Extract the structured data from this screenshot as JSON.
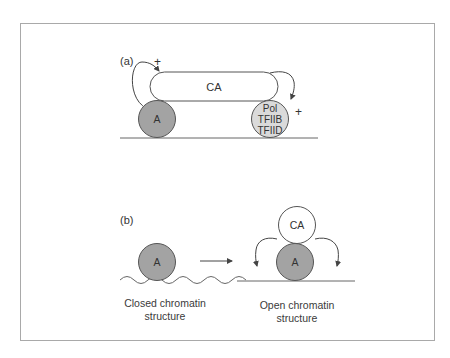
{
  "figure": {
    "panel_a": {
      "label": "(a)",
      "ca_label": "CA",
      "activator_label": "A",
      "complex_lines": [
        "Pol",
        "TFIIB",
        "TFIID"
      ],
      "plus_left": "+",
      "plus_right": "+"
    },
    "panel_b": {
      "label": "(b)",
      "activator_closed_label": "A",
      "ca_label": "CA",
      "activator_open_label": "A",
      "caption_closed": [
        "Closed chromatin",
        "structure"
      ],
      "caption_open": [
        "Open chromatin",
        "structure"
      ]
    },
    "colors": {
      "activator_fill": "#a3a3a3",
      "complex_fill": "#dadada",
      "ca_fill": "#ffffff",
      "stroke": "#555555",
      "frame": "#a9a9a9"
    }
  }
}
